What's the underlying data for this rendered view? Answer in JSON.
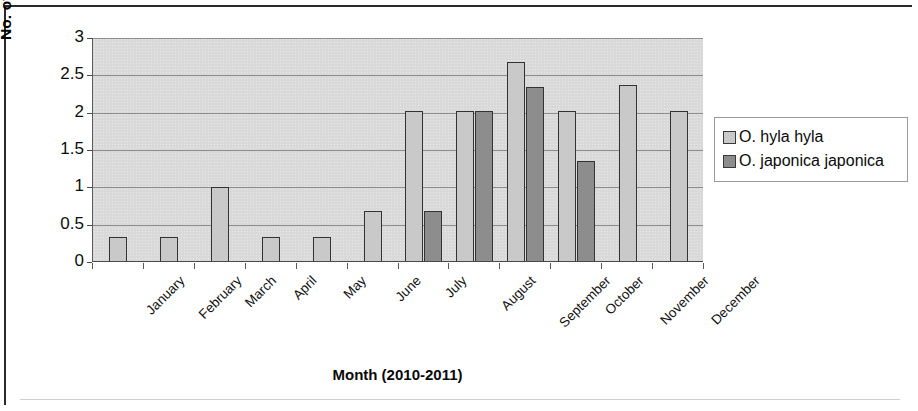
{
  "chart_data": {
    "type": "bar",
    "title": "",
    "xlabel": "Month (2010-2011)",
    "ylabel": "No. of individual/15m",
    "ylabel_superscript": "2",
    "categories": [
      "January",
      "February",
      "March",
      "April",
      "May",
      "June",
      "July",
      "August",
      "September",
      "October",
      "November",
      "December"
    ],
    "series": [
      {
        "name": "O. hyla hyla",
        "color": "#c9c9c9",
        "values": [
          0.33,
          0.33,
          1.0,
          0.33,
          0.34,
          0.68,
          2.02,
          2.02,
          2.68,
          2.02,
          2.37,
          2.02
        ]
      },
      {
        "name": "O. japonica japonica",
        "color": "#8d8d8d",
        "values": [
          0,
          0,
          0,
          0,
          0,
          0,
          0.68,
          2.02,
          2.35,
          1.35,
          0,
          0
        ]
      }
    ],
    "ylim": [
      0,
      3
    ],
    "yticks": [
      0,
      0.5,
      1,
      1.5,
      2,
      2.5,
      3
    ],
    "ytick_labels": [
      "0",
      "0.5",
      "1",
      "1.5",
      "2",
      "2.5",
      "3"
    ],
    "grid": "horizontal",
    "legend_position": "right",
    "plot_background": "#d9d9d9"
  },
  "legend": {
    "entries": [
      {
        "label": "O. hyla hyla"
      },
      {
        "label": "O. japonica japonica"
      }
    ]
  }
}
